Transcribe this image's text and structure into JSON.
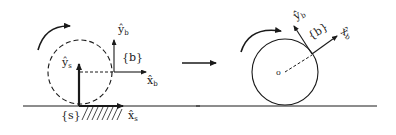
{
  "diagram": {
    "left_panel": {
      "space_frame_label": "{s}",
      "space_x_axis": {
        "hat": "x̂",
        "sub": "s"
      },
      "space_y_axis": {
        "hat": "ŷ",
        "sub": "s"
      },
      "body_frame_label": "{b}",
      "body_x_axis": {
        "hat": "x̂",
        "sub": "b"
      },
      "body_y_axis": {
        "hat": "ŷ",
        "sub": "b"
      },
      "circle_style": "dashed"
    },
    "transition_arrow": "right-arrow",
    "right_panel": {
      "center_label": "o",
      "body_frame_label": "{b}",
      "body_x_axis": {
        "hat": "x̂",
        "sub": "b"
      },
      "body_y_axis": {
        "hat": "ŷ",
        "sub": "b"
      },
      "circle_style": "solid"
    },
    "colors": {
      "stroke": "#1a1a1a",
      "background": "#ffffff"
    }
  }
}
